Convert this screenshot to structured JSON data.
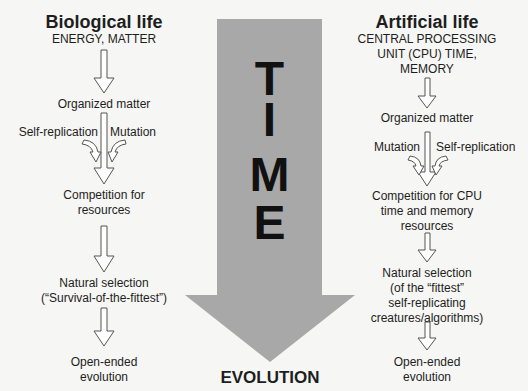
{
  "center": {
    "letters": [
      "T",
      "I",
      "M",
      "E"
    ],
    "bottom_label": "EVOLUTION",
    "arrow_color": "#a8a8a8"
  },
  "left": {
    "title": "Biological life",
    "subtitle": "ENERGY, MATTER",
    "step1": "Organized matter",
    "side_left": "Self-replication",
    "side_right": "Mutation",
    "step2_line1": "Competition for",
    "step2_line2": "resources",
    "step3_line1": "Natural selection",
    "step3_line2": "(“Survival-of-the-fittest”)",
    "step4_line1": "Open-ended",
    "step4_line2": "evolution"
  },
  "right": {
    "title": "Artificial life",
    "subtitle_line1": "CENTRAL PROCESSING",
    "subtitle_line2": "UNIT (CPU) TIME,",
    "subtitle_line3": "MEMORY",
    "step1": "Organized matter",
    "side_left": "Mutation",
    "side_right": "Self-replication",
    "step2_line1": "Competition for CPU",
    "step2_line2": "time and memory",
    "step2_line3": "resources",
    "step3_line1": "Natural selection",
    "step3_line2": "(of the “fittest”",
    "step3_line3": "self-replicating",
    "step3_line4": "creatures/algorithms)",
    "step4_line1": "Open-ended",
    "step4_line2": "evolution"
  }
}
